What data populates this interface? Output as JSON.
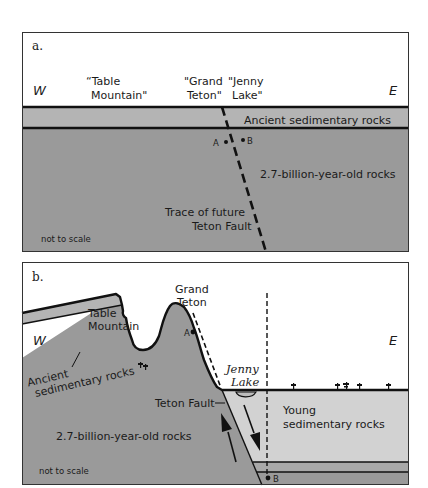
{
  "colors": {
    "basement": "#9a9a9a",
    "ancient_sed": "#b4b4b4",
    "young_sed": "#d2d2d2",
    "line": "#111111",
    "background": "#ffffff"
  },
  "panel_a": {
    "label": "a.",
    "west": "W",
    "east": "E",
    "table_mountain_line1": "“Table",
    "table_mountain_line2": "Mountain\"",
    "grand_teton_line1": "\"Grand",
    "grand_teton_line2": "Teton\"",
    "jenny_lake_line1": "\"Jenny",
    "jenny_lake_line2": "Lake\"",
    "ancient_sed_label": "Ancient sedimentary rocks",
    "basement_label": "2.7-billion-year-old rocks",
    "fault_label_line1": "Trace of future",
    "fault_label_line2": "Teton Fault",
    "point_a": "A",
    "point_b": "B",
    "scale_note": "not to scale"
  },
  "panel_b": {
    "label": "b.",
    "west": "W",
    "east": "E",
    "table_mountain_line1": "Table",
    "table_mountain_line2": "Mountain",
    "grand_teton_line1": "Grand",
    "grand_teton_line2": "Teton",
    "jenny_lake_line1": "Jenny",
    "jenny_lake_line2": "Lake",
    "ancient_sed_line1": "Ancient",
    "ancient_sed_line2": "sedimentary rocks",
    "fault_label": "Teton Fault",
    "young_sed_line1": "Young",
    "young_sed_line2": "sedimentary rocks",
    "basement_label": "2.7-billion-year-old rocks",
    "point_a": "A",
    "point_b": "B",
    "scale_note": "not to scale"
  }
}
